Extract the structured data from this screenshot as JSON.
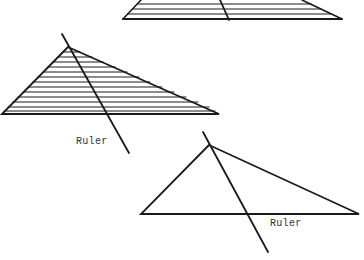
{
  "labels": {
    "ruler_1": "Ruler",
    "ruler_2": "Ruler"
  },
  "colors": {
    "ink": "#1a1a1a",
    "background": "#ffffff"
  }
}
